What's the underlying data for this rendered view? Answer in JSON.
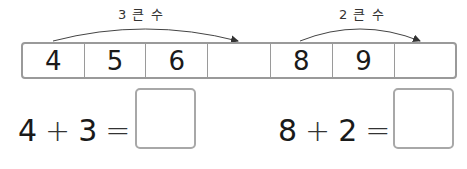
{
  "arrows": [
    {
      "label": "3 큰 수",
      "from_cell": 0,
      "to_cell": 3
    },
    {
      "label": "2 큰 수",
      "from_cell": 4,
      "to_cell": 6
    }
  ],
  "number_strip": {
    "cells": [
      "4",
      "5",
      "6",
      "",
      "8",
      "9",
      ""
    ]
  },
  "equations": [
    {
      "a": "4",
      "op": "+",
      "b": "3",
      "eq": "=",
      "answer": ""
    },
    {
      "a": "8",
      "op": "+",
      "b": "2",
      "eq": "=",
      "answer": ""
    }
  ]
}
